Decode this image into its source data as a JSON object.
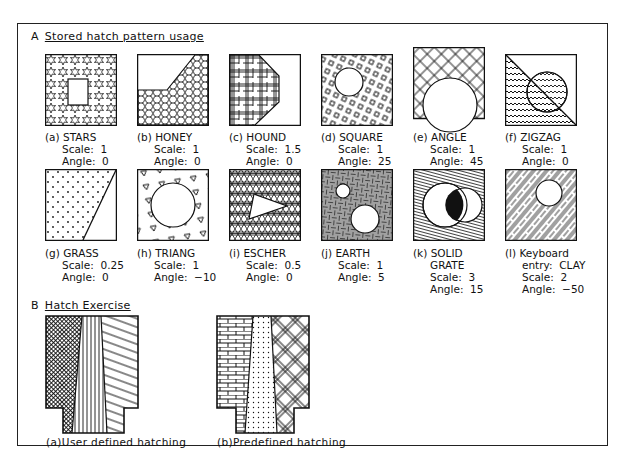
{
  "section_a": {
    "letter": "A",
    "title": "Stored hatch pattern usage"
  },
  "section_b": {
    "letter": "B",
    "title": "Hatch Exercise"
  },
  "patterns": [
    {
      "id": "a",
      "name": "STARS",
      "lines": [
        "Scale:  1",
        "Angle:  0"
      ]
    },
    {
      "id": "b",
      "name": "HONEY",
      "lines": [
        "Scale:  1",
        "Angle:  0"
      ]
    },
    {
      "id": "c",
      "name": "HOUND",
      "lines": [
        "Scale:  1.5",
        "Angle:  0"
      ]
    },
    {
      "id": "d",
      "name": "SQUARE",
      "lines": [
        "Scale:  1",
        "Angle:  25"
      ]
    },
    {
      "id": "e",
      "name": "ANGLE",
      "lines": [
        "Scale:  1",
        "Angle:  45"
      ]
    },
    {
      "id": "f",
      "name": "ZIGZAG",
      "lines": [
        "Scale:  1",
        "Angle:  0"
      ]
    },
    {
      "id": "g",
      "name": "GRASS",
      "lines": [
        "Scale:  0.25",
        "Angle:  0"
      ]
    },
    {
      "id": "h",
      "name": "TRIANG",
      "lines": [
        "Scale:  1",
        "Angle:  −10"
      ]
    },
    {
      "id": "i",
      "name": "ESCHER",
      "lines": [
        "Scale:  0.5",
        "Angle:  0"
      ]
    },
    {
      "id": "j",
      "name": "EARTH",
      "lines": [
        "Scale:  1",
        "Angle:  5"
      ]
    },
    {
      "id": "k",
      "name": "SOLID",
      "lines": [
        "GRATE",
        "Scale:  3",
        "Angle:  15"
      ]
    },
    {
      "id": "l",
      "name": "Keyboard",
      "lines": [
        "entry:  CLAY",
        "Scale:  2",
        "Angle:  −50"
      ]
    }
  ],
  "labels": {
    "a": "(a)",
    "b": "(b)",
    "c": "(c)",
    "d": "(d)",
    "e": "(e)",
    "f": "(f)",
    "g": "(g)",
    "h": "(h)",
    "i": "(i)",
    "j": "(j)",
    "k": "(k)",
    "l": "(l)"
  },
  "exercise": {
    "user_defined": "(a)User  defined  hatching",
    "predefined": "(b)Predefined  hatching"
  }
}
